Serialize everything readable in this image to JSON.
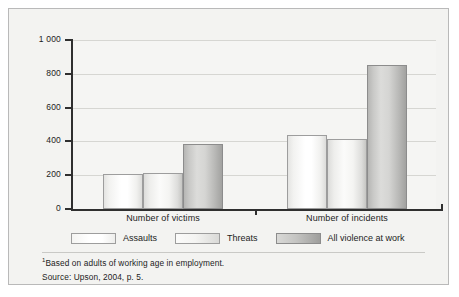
{
  "chart_data": {
    "type": "bar",
    "title": "",
    "xlabel": "",
    "ylabel": "",
    "ylim": [
      0,
      1000
    ],
    "grid": true,
    "legend_position": "bottom",
    "categories": [
      "Number of victims",
      "Number of incidents"
    ],
    "series": [
      {
        "name": "Assaults",
        "values": [
          205,
          440
        ]
      },
      {
        "name": "Threats",
        "values": [
          215,
          415
        ]
      },
      {
        "name": "All violence at work",
        "values": [
          385,
          855
        ]
      }
    ],
    "yticks": [
      {
        "value": 1000,
        "label": "1 000"
      },
      {
        "value": 800,
        "label": "800"
      },
      {
        "value": 600,
        "label": "600"
      },
      {
        "value": 400,
        "label": "400"
      },
      {
        "value": 200,
        "label": "200"
      },
      {
        "value": 0,
        "label": "0"
      }
    ]
  },
  "legend": {
    "items": [
      {
        "label": "Assaults",
        "style": "light"
      },
      {
        "label": "Threats",
        "style": "mid"
      },
      {
        "label": "All violence at work",
        "style": "dark"
      }
    ]
  },
  "footnotes": {
    "marker": "1",
    "note": "Based on adults of working age in employment.",
    "source": "Source: Upson, 2004, p. 5."
  },
  "colors": {
    "panel_background": "#f3f3f1",
    "panel_border": "#b9b9b9",
    "axis": "#2f2f2f",
    "gridline": "#d6d6d2",
    "text": "#1c1c1c",
    "bar_light": "#ffffff",
    "bar_mid": "#f4f4f2",
    "bar_dark": "#c4c4c2"
  }
}
